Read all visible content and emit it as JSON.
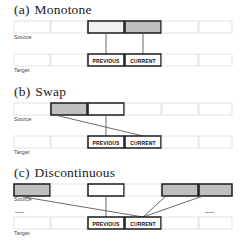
{
  "figure": {
    "background": "#ffffff",
    "row_labels": {
      "source": "Source",
      "target": "Target"
    },
    "cell_labels": {
      "previous": "PREVIOUS",
      "current": "CURRENT"
    },
    "ellipsis": "······",
    "colors": {
      "grid_stroke": "#d9d9d9",
      "grid_fill": "#ffffff",
      "highlight_stroke": "#1a1a1a",
      "shade_dark": "#bdbdbd",
      "shade_light": "#ededed",
      "link_stroke": "#555555",
      "text": "#1a1a1a"
    },
    "panels": [
      {
        "id": "a",
        "tag": "(a)",
        "title": "Monotone",
        "source_cells": [
          {
            "index": 1,
            "style": "plain"
          },
          {
            "index": 2,
            "style": "plain"
          },
          {
            "index": 3,
            "style": "highlight-light"
          },
          {
            "index": 4,
            "style": "highlight-dark"
          },
          {
            "index": 5,
            "style": "plain"
          },
          {
            "index": 6,
            "style": "plain"
          }
        ],
        "target_cells": [
          {
            "index": 1,
            "style": "plain",
            "label": ""
          },
          {
            "index": 2,
            "style": "plain",
            "label": ""
          },
          {
            "index": 3,
            "style": "highlight",
            "label": "PREVIOUS"
          },
          {
            "index": 4,
            "style": "highlight",
            "label": "CURRENT"
          },
          {
            "index": 5,
            "style": "plain",
            "label": ""
          },
          {
            "index": 6,
            "style": "plain",
            "label": ""
          }
        ],
        "links": [
          {
            "from_source": 3,
            "to_target": 3,
            "kind": "vertical"
          },
          {
            "from_source": 4,
            "to_target": 4,
            "kind": "vertical"
          }
        ]
      },
      {
        "id": "b",
        "tag": "(b)",
        "title": "Swap",
        "source_cells": [
          {
            "index": 1,
            "style": "plain"
          },
          {
            "index": 2,
            "style": "highlight-dark"
          },
          {
            "index": 3,
            "style": "highlight-light"
          },
          {
            "index": 4,
            "style": "plain"
          },
          {
            "index": 5,
            "style": "plain"
          },
          {
            "index": 6,
            "style": "plain"
          }
        ],
        "target_cells": [
          {
            "index": 1,
            "style": "plain",
            "label": ""
          },
          {
            "index": 2,
            "style": "plain",
            "label": ""
          },
          {
            "index": 3,
            "style": "highlight",
            "label": "PREVIOUS"
          },
          {
            "index": 4,
            "style": "highlight",
            "label": "CURRENT"
          },
          {
            "index": 5,
            "style": "plain",
            "label": ""
          },
          {
            "index": 6,
            "style": "plain",
            "label": ""
          }
        ],
        "links": [
          {
            "from_source": 2,
            "to_target": 4,
            "kind": "diagonal"
          },
          {
            "from_source": 3,
            "to_target": 3,
            "kind": "vertical"
          }
        ]
      },
      {
        "id": "c",
        "tag": "(c)",
        "title": "Discontinuous",
        "source_cells": [
          {
            "index": 1,
            "style": "highlight-dark"
          },
          {
            "index": 2,
            "style": "plain"
          },
          {
            "index": 3,
            "style": "highlight-light"
          },
          {
            "index": 4,
            "style": "plain"
          },
          {
            "index": 5,
            "style": "highlight-dark"
          },
          {
            "index": 6,
            "style": "highlight-dark"
          }
        ],
        "target_cells": [
          {
            "index": 1,
            "style": "plain",
            "label": ""
          },
          {
            "index": 2,
            "style": "plain",
            "label": ""
          },
          {
            "index": 3,
            "style": "highlight",
            "label": "PREVIOUS"
          },
          {
            "index": 4,
            "style": "highlight",
            "label": "CURRENT"
          },
          {
            "index": 5,
            "style": "plain",
            "label": ""
          },
          {
            "index": 6,
            "style": "plain",
            "label": ""
          }
        ],
        "links": [
          {
            "from_source": 1,
            "to_target": 4,
            "kind": "diagonal"
          },
          {
            "from_source": 3,
            "to_target": 3,
            "kind": "vertical"
          },
          {
            "from_source": 5,
            "to_target": 4,
            "kind": "diagonal"
          },
          {
            "from_source": 6,
            "to_target": 4,
            "kind": "diagonal"
          }
        ],
        "ellipsis_marks": [
          "left",
          "right"
        ]
      }
    ]
  }
}
